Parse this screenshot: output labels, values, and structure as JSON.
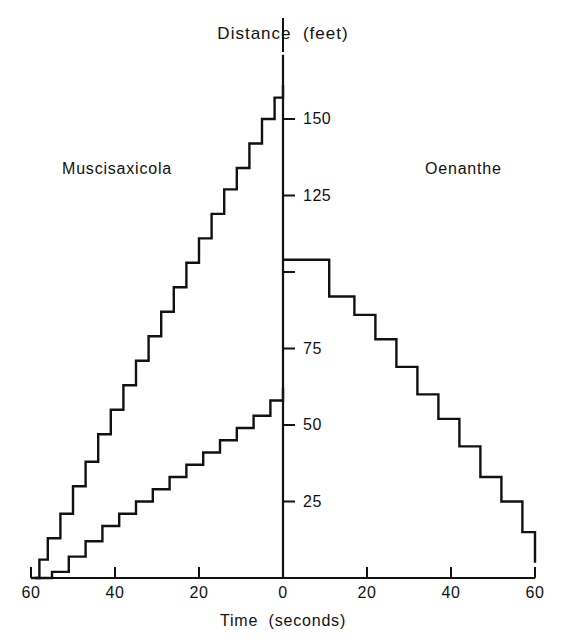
{
  "chart_data": {
    "type": "line",
    "title": "Distance  (feet)",
    "xlabel": "Time  (seconds)",
    "ylabel": "Distance (feet)",
    "xlim": [
      -60,
      60
    ],
    "ylim": [
      0,
      165
    ],
    "grid": false,
    "legend_position": "in-plot",
    "xtick_labels": [
      "60",
      "40",
      "20",
      "0",
      "20",
      "40",
      "60"
    ],
    "xtick_values": [
      -60,
      -40,
      -20,
      0,
      20,
      40,
      60
    ],
    "ytick_labels": [
      "150",
      "125",
      "75",
      "50",
      "25"
    ],
    "ytick_values": [
      150,
      125,
      100,
      75,
      50,
      25
    ],
    "ytick_labeled": [
      true,
      true,
      false,
      true,
      true,
      true
    ],
    "annotations": [
      {
        "text": "Muscisaxicola",
        "x": -42,
        "y": 138
      },
      {
        "text": "Oenanthe",
        "x": 38,
        "y": 138
      }
    ],
    "series": [
      {
        "name": "Muscisaxicola upper",
        "step": "post",
        "x": [
          -60,
          -58,
          -56,
          -53,
          -50,
          -47,
          -44,
          -41,
          -38,
          -35,
          -32,
          -29,
          -26,
          -23,
          -20,
          -17,
          -14,
          -11,
          -8,
          -5,
          -2,
          0
        ],
        "y": [
          0,
          6,
          13,
          21,
          30,
          38,
          47,
          55,
          63,
          71,
          79,
          87,
          95,
          103,
          111,
          119,
          127,
          134,
          142,
          150,
          157,
          161
        ]
      },
      {
        "name": "Muscisaxicola lower",
        "step": "post",
        "x": [
          -59,
          -55,
          -51,
          -47,
          -43,
          -39,
          -35,
          -31,
          -27,
          -23,
          -19,
          -15,
          -11,
          -7,
          -3,
          0
        ],
        "y": [
          0,
          2,
          7,
          12,
          17,
          21,
          25,
          29,
          33,
          37,
          41,
          45,
          49,
          53,
          58,
          62
        ]
      },
      {
        "name": "Oenanthe",
        "step": "post",
        "x": [
          0,
          5,
          11,
          17,
          22,
          27,
          32,
          37,
          42,
          47,
          52,
          57,
          60
        ],
        "y": [
          104,
          104,
          92,
          86,
          78,
          69,
          60,
          52,
          43,
          33,
          25,
          15,
          5
        ]
      }
    ]
  },
  "axes": {
    "x_title": "Time  (seconds)",
    "y_title": "Distance  (feet)"
  }
}
